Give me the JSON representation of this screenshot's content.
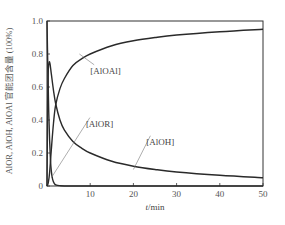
{
  "chart_data": {
    "type": "line",
    "title": "",
    "xlabel": "t/min",
    "ylabel": "AlOR, AlOH, AlOAl 官能团含量 (100%)",
    "xlim": [
      0,
      50
    ],
    "ylim": [
      0,
      1.0
    ],
    "xticks": [
      10,
      20,
      30,
      40,
      50
    ],
    "xtick_labels": [
      "10",
      "20",
      "30",
      "40",
      "50"
    ],
    "yticks": [
      0,
      0.2,
      0.4,
      0.6,
      0.8,
      1.0
    ],
    "ytick_labels": [
      "0",
      "0.2",
      "0.4",
      "0.6",
      "0.8",
      "1.0"
    ],
    "grid": false,
    "legend": "none (inline annotations)",
    "series": [
      {
        "name": "[AlOR]",
        "x": [
          0,
          0.2,
          0.4,
          0.6,
          0.8,
          1.0,
          1.3,
          1.7,
          2.2,
          3,
          5,
          10,
          50
        ],
        "y": [
          1.0,
          0.7,
          0.45,
          0.28,
          0.16,
          0.09,
          0.04,
          0.015,
          0.005,
          0.002,
          0.0,
          0.0,
          0.0
        ]
      },
      {
        "name": "[AlOH]",
        "x": [
          0,
          0.15,
          0.3,
          0.5,
          0.7,
          1.0,
          1.5,
          2,
          3,
          4,
          6,
          8,
          10,
          15,
          20,
          25,
          30,
          40,
          50
        ],
        "y": [
          0.0,
          0.5,
          0.7,
          0.75,
          0.74,
          0.68,
          0.58,
          0.5,
          0.4,
          0.34,
          0.27,
          0.23,
          0.2,
          0.15,
          0.12,
          0.1,
          0.085,
          0.065,
          0.05
        ]
      },
      {
        "name": "[AlOAl]",
        "x": [
          0,
          0.3,
          0.6,
          1.0,
          1.5,
          2,
          3,
          4,
          6,
          8,
          10,
          15,
          20,
          25,
          30,
          40,
          50
        ],
        "y": [
          0.0,
          0.02,
          0.08,
          0.22,
          0.38,
          0.49,
          0.59,
          0.65,
          0.73,
          0.77,
          0.8,
          0.85,
          0.88,
          0.9,
          0.915,
          0.935,
          0.95
        ]
      }
    ],
    "annotations": [
      {
        "text": "[AlOAl]",
        "x": 10,
        "y": 0.68,
        "points_to": {
          "x": 7.5,
          "y": 0.8
        }
      },
      {
        "text": "[AlOR]",
        "x": 9,
        "y": 0.36,
        "points_to": {
          "x": 1.0,
          "y": 0.05
        }
      },
      {
        "text": "[AlOH]",
        "x": 23,
        "y": 0.25,
        "points_to": {
          "x": 20,
          "y": 0.1
        }
      }
    ]
  },
  "labels": {
    "xlabel": "t/min",
    "ylabel": "AlOR, AlOH, AlOAl 官能团含量 (100%)",
    "ann_alo_al": "[AlOAl]",
    "ann_alor": "[AlOR]",
    "ann_aloh": "[AlOH]"
  }
}
